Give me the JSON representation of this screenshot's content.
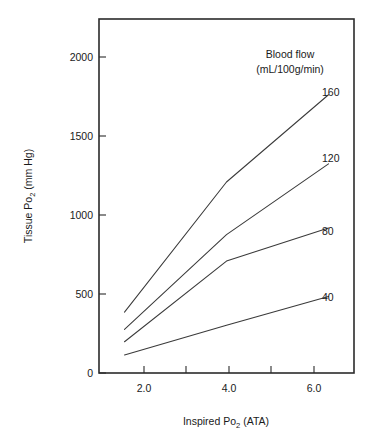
{
  "chart_data": {
    "type": "line",
    "title": "",
    "xlabel_parts": {
      "pre": "Inspired Po",
      "sub": "2",
      "post": " (ATA)"
    },
    "xlabel": "Inspired Po2 (ATA)",
    "ylabel_parts": {
      "pre": "Tissue Po",
      "sub": "2",
      "post": " (mm Hg)"
    },
    "ylabel": "Tissue Po2 (mm Hg)",
    "x": [
      2.0,
      4.0,
      6.0
    ],
    "xlim": [
      1.5,
      6.5
    ],
    "ylim": [
      0,
      2150
    ],
    "xticks": [
      2.0,
      3.0,
      4.0,
      5.0,
      6.0
    ],
    "xtick_labels": [
      "2.0",
      "",
      "4.0",
      "",
      "6.0"
    ],
    "yticks": [
      0,
      500,
      1000,
      1500,
      2000
    ],
    "ytick_labels": [
      "0",
      "500",
      "1000",
      "1500",
      "2000"
    ],
    "grid": false,
    "legend_position": "right-inside",
    "legend_title_line1": "Blood flow",
    "legend_title_line2": "(mL/100g/min)",
    "series": [
      {
        "name": "160",
        "label": "160",
        "values": [
          370,
          1160,
          1690
        ]
      },
      {
        "name": "120",
        "label": "120",
        "values": [
          265,
          840,
          1270
        ]
      },
      {
        "name": "80",
        "label": "80",
        "values": [
          190,
          680,
          880
        ]
      },
      {
        "name": "40",
        "label": "40",
        "values": [
          110,
          290,
          465
        ]
      }
    ],
    "line_color": "#3a3a3a",
    "axis_color": "#2b2b2b",
    "background_color": "#ffffff"
  }
}
